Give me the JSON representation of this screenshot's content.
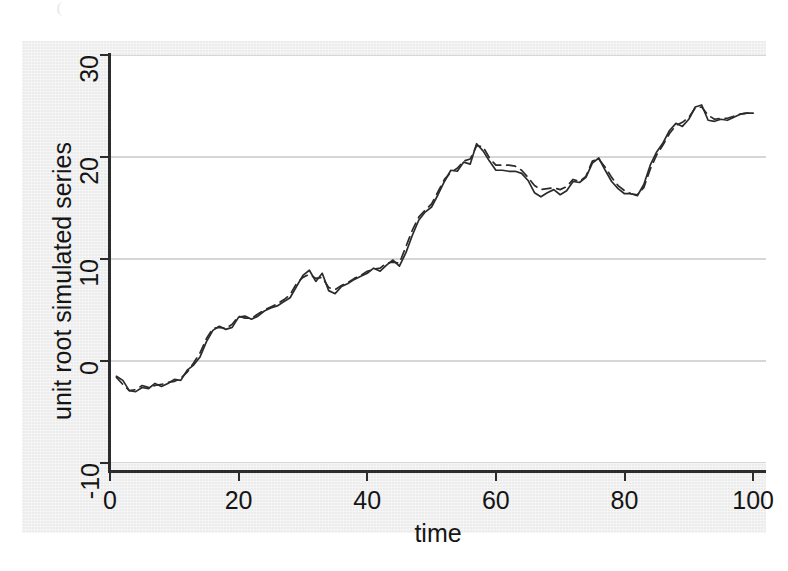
{
  "chart_data": {
    "type": "line",
    "title": "",
    "xlabel": "time",
    "ylabel": "unit root simulated series",
    "xlim": [
      0,
      102
    ],
    "ylim": [
      -10,
      30
    ],
    "xticks": [
      0,
      20,
      40,
      60,
      80,
      100
    ],
    "yticks": [
      -10,
      0,
      10,
      20,
      30
    ],
    "grid": "horizontal",
    "legend": "none",
    "colors": {
      "line": "#2b2b2b",
      "grid": "#c9c9c9",
      "axis": "#2c2c2c",
      "plot_background": "#ffffff",
      "figure_background": "#ececec"
    },
    "x": [
      1,
      2,
      3,
      4,
      5,
      6,
      7,
      8,
      9,
      10,
      11,
      12,
      13,
      14,
      15,
      16,
      17,
      18,
      19,
      20,
      21,
      22,
      23,
      24,
      25,
      26,
      27,
      28,
      29,
      30,
      31,
      32,
      33,
      34,
      35,
      36,
      37,
      38,
      39,
      40,
      41,
      42,
      43,
      44,
      45,
      46,
      47,
      48,
      49,
      50,
      51,
      52,
      53,
      54,
      55,
      56,
      57,
      58,
      59,
      60,
      61,
      62,
      63,
      64,
      65,
      66,
      67,
      68,
      69,
      70,
      71,
      72,
      73,
      74,
      75,
      76,
      77,
      78,
      79,
      80,
      81,
      82,
      83,
      84,
      85,
      86,
      87,
      88,
      89,
      90,
      91,
      92,
      93,
      94,
      95,
      96,
      97,
      98,
      99,
      100
    ],
    "series": [
      {
        "name": "solid series",
        "style": "solid",
        "values": [
          -1.5,
          -1.9,
          -2.9,
          -3.0,
          -2.6,
          -2.7,
          -2.2,
          -2.5,
          -2.2,
          -1.8,
          -1.9,
          -0.9,
          -0.4,
          0.4,
          1.9,
          3.0,
          3.4,
          3.1,
          3.3,
          4.3,
          4.4,
          4.1,
          4.4,
          4.9,
          5.2,
          5.4,
          5.8,
          6.2,
          7.3,
          8.4,
          8.9,
          7.8,
          8.6,
          6.9,
          6.6,
          7.3,
          7.6,
          8.0,
          8.3,
          8.6,
          9.1,
          8.8,
          9.4,
          9.9,
          9.3,
          10.6,
          12.3,
          13.8,
          14.6,
          15.1,
          16.3,
          17.6,
          18.7,
          18.6,
          19.5,
          19.3,
          21.3,
          20.6,
          19.6,
          18.7,
          18.7,
          18.6,
          18.6,
          18.4,
          17.7,
          16.5,
          16.1,
          16.5,
          16.8,
          16.3,
          16.7,
          17.6,
          17.5,
          18.0,
          19.4,
          19.9,
          18.7,
          17.6,
          16.9,
          16.4,
          16.4,
          16.2,
          17.3,
          19.2,
          20.5,
          21.4,
          22.6,
          23.3,
          23.0,
          23.7,
          24.9,
          25.1,
          23.6,
          23.5,
          23.7,
          23.6,
          23.9,
          24.2,
          24.3,
          24.3
        ]
      },
      {
        "name": "dashed series",
        "style": "dashed",
        "values": [
          -1.6,
          -2.3,
          -2.9,
          -2.8,
          -2.4,
          -2.6,
          -2.4,
          -2.3,
          -2.1,
          -2.0,
          -1.7,
          -1.1,
          -0.2,
          0.8,
          2.2,
          3.2,
          3.3,
          3.2,
          3.6,
          4.4,
          4.2,
          4.2,
          4.6,
          5.0,
          5.3,
          5.6,
          6.0,
          6.5,
          7.6,
          8.2,
          8.5,
          8.1,
          8.2,
          7.2,
          7.0,
          7.4,
          7.7,
          8.1,
          8.4,
          8.8,
          9.0,
          9.1,
          9.6,
          9.7,
          9.6,
          11.2,
          12.8,
          14.1,
          14.8,
          15.4,
          16.6,
          17.8,
          18.5,
          18.9,
          19.6,
          19.8,
          21.1,
          21.0,
          19.9,
          19.2,
          19.2,
          19.2,
          19.1,
          18.7,
          18.0,
          17.2,
          16.8,
          16.9,
          17.0,
          16.8,
          17.1,
          17.8,
          17.6,
          18.1,
          19.6,
          19.8,
          19.0,
          18.0,
          17.2,
          16.7,
          16.4,
          16.3,
          17.0,
          18.8,
          20.2,
          21.2,
          22.3,
          23.1,
          23.4,
          23.9,
          24.8,
          24.9,
          24.1,
          23.7,
          23.8,
          23.8,
          24.0,
          24.2,
          24.3,
          24.3
        ]
      }
    ]
  },
  "axes": {
    "x_title": "time",
    "y_title": "unit root simulated series",
    "x_tick_labels": [
      "0",
      "20",
      "40",
      "60",
      "80",
      "100"
    ],
    "y_tick_labels": [
      "-10",
      "0",
      "10",
      "20",
      "30"
    ]
  }
}
